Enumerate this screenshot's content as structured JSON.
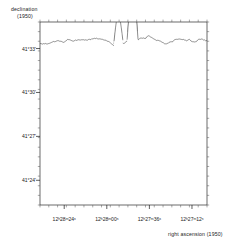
{
  "figure": {
    "kind": "hidden-line-surface-map",
    "background_color": "#ffffff",
    "mesh_color": "#2b2b2b",
    "fill_color": "#d9d9d9"
  },
  "axes": {
    "y_axis": {
      "title_line1": "declination",
      "title_line2": "(1950)",
      "ticks": [
        {
          "label": "41°33'",
          "pos": 0.855
        },
        {
          "label": "41°30'",
          "pos": 0.615
        },
        {
          "label": "41°27'",
          "pos": 0.375
        },
        {
          "label": "41°24'",
          "pos": 0.135
        }
      ],
      "minor_tick_count": 19
    },
    "x_axis": {
      "title": "right ascension (1950)",
      "ticks": [
        {
          "label": "12ʰ28ᵐ24ˢ",
          "pos": 0.145
        },
        {
          "label": "12ʰ28ᵐ00ˢ",
          "pos": 0.4
        },
        {
          "label": "12ʰ27ᵐ36ˢ",
          "pos": 0.655
        },
        {
          "label": "12ʰ27ᵐ12ˢ",
          "pos": 0.91
        }
      ],
      "minor_tick_count": 19
    }
  },
  "chart_data": {
    "type": "surface",
    "title": "",
    "xlabel": "right ascension (1950)",
    "ylabel": "declination (1950)",
    "x_tick_labels": [
      "12h28m24s",
      "12h28m00s",
      "12h27m36s",
      "12h27m12s"
    ],
    "y_tick_labels": [
      "41°33'",
      "41°30'",
      "41°27'",
      "41°24'"
    ],
    "grid": false,
    "legend": "none",
    "features": [
      {
        "name": "primary-peak",
        "x": 0.555,
        "y": 0.5,
        "relative_height": 1.0
      },
      {
        "name": "secondary-peak",
        "x": 0.47,
        "y": 0.66,
        "relative_height": 0.62
      },
      {
        "name": "tertiary-peak",
        "x": 0.305,
        "y": 0.33,
        "relative_height": 0.33
      },
      {
        "name": "quaternary-peak",
        "x": 0.18,
        "y": 0.3,
        "relative_height": 0.22
      }
    ],
    "noise_level": 0.055
  }
}
